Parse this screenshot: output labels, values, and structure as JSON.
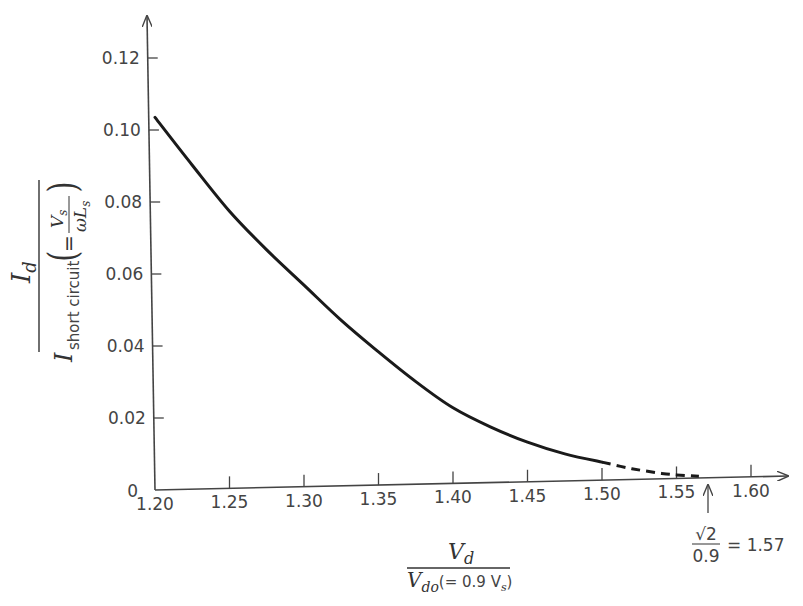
{
  "chart_data": {
    "type": "line",
    "title": "",
    "xlabel": "V_d / V_do(= 0.9 V_s)",
    "ylabel": "I_d / I_short circuit (= V_s / ωL_s)",
    "xlim": [
      1.2,
      1.62
    ],
    "ylim": [
      0,
      0.13
    ],
    "grid": false,
    "x_ticks": [
      "1.20",
      "1.25",
      "1.30",
      "1.35",
      "1.40",
      "1.45",
      "1.50",
      "1.55",
      "1.60"
    ],
    "y_ticks": [
      "0",
      "0.02",
      "0.04",
      "0.06",
      "0.08",
      "0.10",
      "0.12"
    ],
    "series": [
      {
        "name": "solid",
        "style": "solid",
        "x": [
          1.2,
          1.225,
          1.25,
          1.275,
          1.3,
          1.325,
          1.35,
          1.375,
          1.4,
          1.425,
          1.45,
          1.475,
          1.5
        ],
        "values": [
          0.1035,
          0.09,
          0.077,
          0.066,
          0.056,
          0.046,
          0.037,
          0.0285,
          0.021,
          0.0155,
          0.011,
          0.0075,
          0.005
        ]
      },
      {
        "name": "dashed",
        "style": "dashed",
        "x": [
          1.5,
          1.52,
          1.54,
          1.55,
          1.565
        ],
        "values": [
          0.005,
          0.003,
          0.0015,
          0.001,
          0.0005
        ]
      }
    ],
    "annotations": [
      {
        "x": 1.57,
        "text_numerator": "√2",
        "text_denominator": "0.9",
        "text_result": "= 1.57",
        "arrow": "up"
      }
    ]
  },
  "labels": {
    "y_num": "I",
    "y_num_sub": "d",
    "y_den": "I",
    "y_den_sub": "short circuit",
    "y_paren_open": "(",
    "y_paren_close": ")",
    "y_eq": "=",
    "y_inner_num": "V",
    "y_inner_num_sub": "s",
    "y_inner_den": "ωL",
    "y_inner_den_sub": "s",
    "x_num": "V",
    "x_num_sub": "d",
    "x_den": "V",
    "x_den_sub": "do",
    "x_den_rest": "(= 0.9 V",
    "x_den_rest_sub": "s",
    "x_den_close": ")",
    "ann_num": "√2",
    "ann_den": "0.9",
    "ann_eq": "= 1.57"
  },
  "colors": {
    "axis": "#444444",
    "curve": "#1a1a1a",
    "text": "#444444"
  }
}
